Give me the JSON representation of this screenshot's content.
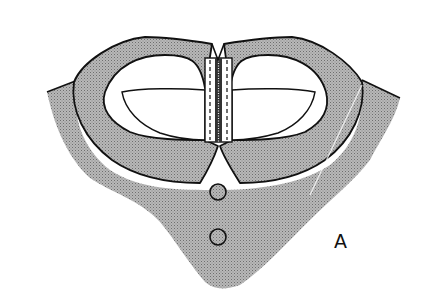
{
  "figure": {
    "label": "A",
    "colors": {
      "fabric": "#a9a9a9",
      "outline": "#111111",
      "background": "#ffffff",
      "opening": "#ffffff"
    },
    "buttons": [
      {
        "cx": 218,
        "cy": 192,
        "r": 8
      },
      {
        "cx": 218,
        "cy": 237,
        "r": 8
      }
    ]
  }
}
